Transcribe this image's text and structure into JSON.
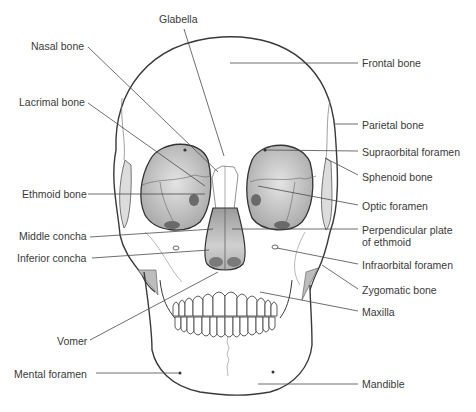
{
  "diagram": {
    "labels_left": [
      {
        "id": "nasal",
        "text": "Nasal bone",
        "x": 31,
        "y": 40
      },
      {
        "id": "lacrimal",
        "text": "Lacrimal bone",
        "x": 19,
        "y": 96
      },
      {
        "id": "ethmoid",
        "text": "Ethmoid bone",
        "x": 22,
        "y": 188
      },
      {
        "id": "middle_concha",
        "text": "Middle concha",
        "x": 19,
        "y": 230
      },
      {
        "id": "inferior_concha",
        "text": "Inferior concha",
        "x": 17,
        "y": 252
      },
      {
        "id": "vomer",
        "text": "Vomer",
        "x": 57,
        "y": 335
      },
      {
        "id": "mental_foramen",
        "text": "Mental foramen",
        "x": 14,
        "y": 368
      }
    ],
    "labels_top": [
      {
        "id": "glabella",
        "text": "Glabella",
        "x": 159,
        "y": 13
      }
    ],
    "labels_right": [
      {
        "id": "frontal",
        "text": "Frontal bone",
        "x": 362,
        "y": 57
      },
      {
        "id": "parietal",
        "text": "Parietal bone",
        "x": 362,
        "y": 119
      },
      {
        "id": "supraorbital",
        "text": "Supraorbital foramen",
        "x": 362,
        "y": 146
      },
      {
        "id": "sphenoid",
        "text": "Sphenoid bone",
        "x": 362,
        "y": 171
      },
      {
        "id": "optic",
        "text": "Optic foramen",
        "x": 362,
        "y": 200
      },
      {
        "id": "perp_plate_1",
        "text": "Perpendicular plate",
        "x": 362,
        "y": 224
      },
      {
        "id": "perp_plate_2",
        "text": "of ethmoid",
        "x": 362,
        "y": 236
      },
      {
        "id": "infraorbital",
        "text": "Infraorbital foramen",
        "x": 362,
        "y": 259
      },
      {
        "id": "zygomatic",
        "text": "Zygomatic bone",
        "x": 362,
        "y": 284
      },
      {
        "id": "maxilla",
        "text": "Maxilla",
        "x": 362,
        "y": 306
      },
      {
        "id": "mandible",
        "text": "Mandible",
        "x": 362,
        "y": 378
      }
    ],
    "colors": {
      "outline": "#3a3a3a",
      "leader": "#4a4a4a",
      "orbit_fill": "#c8c8c8",
      "label_text": "#3a3a3a"
    }
  }
}
